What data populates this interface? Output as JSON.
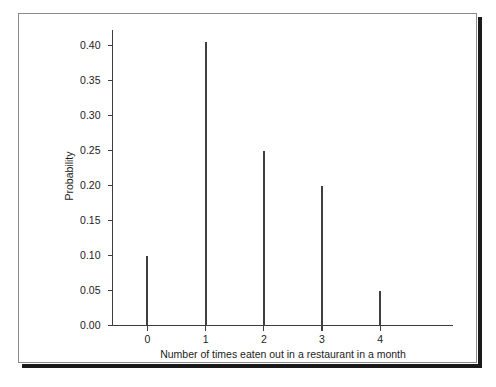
{
  "chart_data": {
    "type": "bar",
    "title": "",
    "subtitle": "",
    "xlabel": "Number of times eaten out in a restaurant in a month",
    "ylabel": "Probability",
    "categories": [
      "0",
      "1",
      "2",
      "3",
      "4"
    ],
    "values": [
      0.1,
      0.405,
      0.25,
      0.2,
      0.05
    ],
    "series": [
      {
        "name": "Probability",
        "values": [
          0.1,
          0.405,
          0.25,
          0.2,
          0.05
        ]
      }
    ],
    "ylim": [
      0.0,
      0.4224
    ],
    "xlim": [
      -0.6,
      5.25
    ],
    "y_ticks": [
      0.0,
      0.05,
      0.1,
      0.15,
      0.2,
      0.25,
      0.3,
      0.35,
      0.4
    ],
    "y_tick_labels": [
      "0.00",
      "0.05",
      "0.10",
      "0.15",
      "0.20",
      "0.25",
      "0.30",
      "0.35",
      "0.40"
    ],
    "x_ticks": [
      0,
      1,
      2,
      3,
      4
    ],
    "x_tick_labels": [
      "0",
      "1",
      "2",
      "3",
      "4"
    ],
    "grid": false,
    "legend": false,
    "legend_position": "none",
    "annotations": [],
    "style": {
      "line_color": "#3f3f3f",
      "axis_color": "#3d3d3d",
      "text_color": "#1c1c1c",
      "background": "#ffffff",
      "frame_border": "#8a8a8a",
      "shadow_color": "#1a1a1a"
    }
  }
}
